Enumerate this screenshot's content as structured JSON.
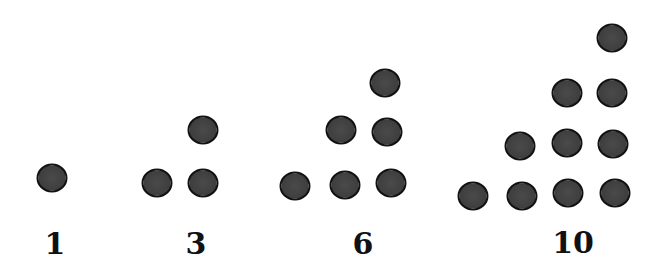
{
  "groups": [
    {
      "label": "1",
      "label_pos": [
        55,
        243
      ],
      "dots": [
        [
          52,
          178
        ]
      ]
    },
    {
      "label": "3",
      "label_pos": [
        196,
        243
      ],
      "dots": [
        [
          157,
          183
        ],
        [
          203,
          183
        ],
        [
          203,
          130
        ]
      ]
    },
    {
      "label": "6",
      "label_pos": [
        363,
        243
      ],
      "dots": [
        [
          295,
          186
        ],
        [
          345,
          185
        ],
        [
          391,
          183
        ],
        [
          341,
          130
        ],
        [
          387,
          132
        ],
        [
          385,
          83
        ]
      ]
    },
    {
      "label": "10",
      "label_pos": [
        573,
        242
      ],
      "dots": [
        [
          473,
          196
        ],
        [
          522,
          196
        ],
        [
          568,
          193
        ],
        [
          615,
          193
        ],
        [
          520,
          146
        ],
        [
          567,
          143
        ],
        [
          613,
          144
        ],
        [
          567,
          93
        ],
        [
          612,
          93
        ],
        [
          612,
          38
        ]
      ]
    }
  ],
  "colors": {
    "dot_fill": "#404040",
    "dot_outline": "#111111",
    "label": "#111111",
    "background": "#ffffff"
  }
}
